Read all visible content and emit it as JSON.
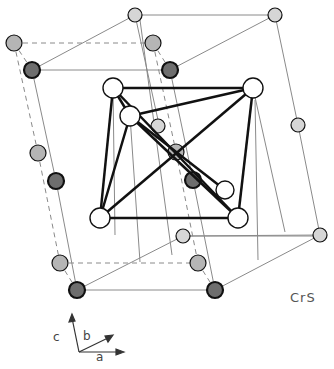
{
  "figure": {
    "compound_label": "CrS",
    "axes": {
      "c": "c",
      "b": "b",
      "a": "a"
    },
    "colors": {
      "background": "#ffffff",
      "thin_line": "#8a8a8a",
      "bold_line": "#111111",
      "atom_white": "#ffffff",
      "atom_light": "#d6d6d6",
      "atom_gray": "#b5b5b5",
      "atom_dark": "#6e6e6e"
    },
    "atoms": [
      {
        "x": 135,
        "y": 15,
        "r": 7,
        "type": "light"
      },
      {
        "x": 275,
        "y": 15,
        "r": 7,
        "type": "light"
      },
      {
        "x": 14,
        "y": 43,
        "r": 8,
        "type": "gray"
      },
      {
        "x": 153,
        "y": 43,
        "r": 8,
        "type": "gray"
      },
      {
        "x": 32,
        "y": 70,
        "r": 8,
        "type": "dark"
      },
      {
        "x": 170,
        "y": 70,
        "r": 8,
        "type": "dark"
      },
      {
        "x": 298,
        "y": 125,
        "r": 7,
        "type": "light"
      },
      {
        "x": 38,
        "y": 153,
        "r": 8,
        "type": "gray"
      },
      {
        "x": 56,
        "y": 181,
        "r": 8,
        "type": "dark"
      },
      {
        "x": 158,
        "y": 126,
        "r": 7,
        "type": "light"
      },
      {
        "x": 176,
        "y": 152,
        "r": 8,
        "type": "gray"
      },
      {
        "x": 193,
        "y": 180,
        "r": 8,
        "type": "dark"
      },
      {
        "x": 183,
        "y": 236,
        "r": 7,
        "type": "light"
      },
      {
        "x": 320,
        "y": 235,
        "r": 7,
        "type": "light"
      },
      {
        "x": 60,
        "y": 263,
        "r": 8,
        "type": "gray"
      },
      {
        "x": 198,
        "y": 263,
        "r": 8,
        "type": "gray"
      },
      {
        "x": 77,
        "y": 290,
        "r": 8,
        "type": "dark"
      },
      {
        "x": 215,
        "y": 290,
        "r": 8,
        "type": "dark"
      }
    ],
    "octahedron": [
      {
        "x": 113,
        "y": 88,
        "r": 10,
        "name": "oct-top-left"
      },
      {
        "x": 253,
        "y": 88,
        "r": 10,
        "name": "oct-top-right"
      },
      {
        "x": 130,
        "y": 116,
        "r": 10,
        "name": "oct-front-top"
      },
      {
        "x": 225,
        "y": 190,
        "r": 9,
        "name": "oct-back-bottom"
      },
      {
        "x": 100,
        "y": 218,
        "r": 10,
        "name": "oct-bottom-left"
      },
      {
        "x": 238,
        "y": 218,
        "r": 10,
        "name": "oct-bottom-right"
      }
    ]
  }
}
